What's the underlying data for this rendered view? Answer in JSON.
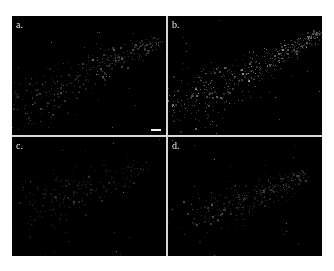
{
  "figure": {
    "panels": [
      {
        "id": "a",
        "label": "a.",
        "has_scale_bar": true,
        "brightness": 0.55,
        "density": 1.0,
        "seed": 11,
        "band": {
          "start": [
            0.05,
            0.75
          ],
          "end": [
            0.95,
            0.2
          ],
          "spread_start": 0.22,
          "spread_end": 0.06
        }
      },
      {
        "id": "b",
        "label": "b.",
        "has_scale_bar": false,
        "brightness": 0.8,
        "density": 1.2,
        "seed": 23,
        "band": {
          "start": [
            0.05,
            0.78
          ],
          "end": [
            0.98,
            0.15
          ],
          "spread_start": 0.25,
          "spread_end": 0.05
        }
      },
      {
        "id": "c",
        "label": "c.",
        "has_scale_bar": false,
        "brightness": 0.35,
        "density": 0.7,
        "seed": 37,
        "band": {
          "start": [
            0.1,
            0.6
          ],
          "end": [
            0.85,
            0.25
          ],
          "spread_start": 0.25,
          "spread_end": 0.08
        }
      },
      {
        "id": "d",
        "label": "d.",
        "has_scale_bar": false,
        "brightness": 0.45,
        "density": 0.9,
        "seed": 51,
        "band": {
          "start": [
            0.15,
            0.7
          ],
          "end": [
            0.9,
            0.3
          ],
          "spread_start": 0.2,
          "spread_end": 0.06
        }
      }
    ]
  }
}
